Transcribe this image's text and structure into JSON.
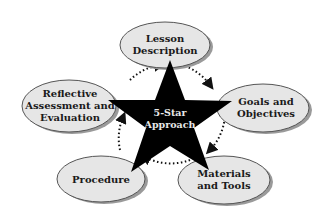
{
  "diagram": {
    "center": {
      "line1": "5-Star",
      "line2": "Approach"
    },
    "nodes": [
      {
        "line1": "Lesson",
        "line2": "Description",
        "line3": ""
      },
      {
        "line1": "Goals and",
        "line2": "Objectives",
        "line3": ""
      },
      {
        "line1": "Materials",
        "line2": "and Tools",
        "line3": ""
      },
      {
        "line1": "Procedure",
        "line2": "",
        "line3": ""
      },
      {
        "line1": "Reflective",
        "line2": "Assessment and",
        "line3": "Evaluation"
      }
    ],
    "colors": {
      "star": "#000000",
      "ellipse_fill": "#e6e6e6",
      "ellipse_stroke": "#555555",
      "shadow": "#9a9a9a",
      "cycle_arrows": "#111111"
    }
  }
}
